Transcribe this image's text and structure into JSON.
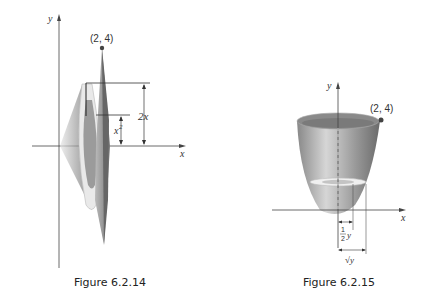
{
  "figures": [
    {
      "id": "fig1",
      "caption": "Figure 6.2.14",
      "axis_x": "x",
      "axis_y": "y",
      "point_label": "(2, 4)",
      "dim_outer": "2x",
      "dim_inner": "x",
      "dim_inner_sup": "2"
    },
    {
      "id": "fig2",
      "caption": "Figure 6.2.15",
      "axis_x": "x",
      "axis_y": "y",
      "point_label": "(2, 4)",
      "dim_inner_num": "1",
      "dim_inner_den": "2",
      "dim_inner_var": "y",
      "dim_outer": "√y"
    }
  ],
  "colors": {
    "dark": "#555555",
    "mid": "#9a9a9a",
    "light": "#d8d8d8",
    "point": "#4a4a4a"
  }
}
